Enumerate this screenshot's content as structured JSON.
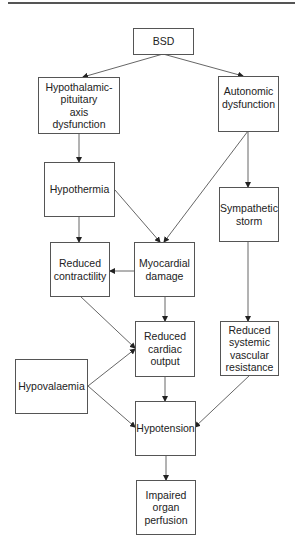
{
  "diagram": {
    "type": "flowchart",
    "nodes": {
      "bsd": "BSD",
      "hpa": "Hypothalamic-\npituitary\naxis\ndysfunction",
      "autonomic": "Autonomic\ndysfunction",
      "hypothermia": "Hypothermia",
      "sympathetic": "Sympathetic\nstorm",
      "contractility": "Reduced\ncontractility",
      "myocardial": "Myocardial\ndamage",
      "cardiac_output": "Reduced\ncardiac\noutput",
      "svr": "Reduced\nsystemic\nvascular\nresistance",
      "hypovolaemia": "Hypovalaemia",
      "hypotension": "Hypotension",
      "perfusion": "Impaired\norgan\nperfusion"
    },
    "edges": [
      [
        "BSD",
        "Hypothalamic-pituitary axis dysfunction"
      ],
      [
        "BSD",
        "Autonomic dysfunction"
      ],
      [
        "Hypothalamic-pituitary axis dysfunction",
        "Hypothermia"
      ],
      [
        "Autonomic dysfunction",
        "Myocardial damage"
      ],
      [
        "Autonomic dysfunction",
        "Sympathetic storm"
      ],
      [
        "Hypothermia",
        "Reduced contractility"
      ],
      [
        "Hypothermia",
        "Myocardial damage"
      ],
      [
        "Myocardial damage",
        "Reduced contractility"
      ],
      [
        "Myocardial damage",
        "Reduced cardiac output"
      ],
      [
        "Reduced contractility",
        "Reduced cardiac output"
      ],
      [
        "Sympathetic storm",
        "Reduced systemic vascular resistance"
      ],
      [
        "Hypovalaemia",
        "Reduced cardiac output"
      ],
      [
        "Hypovalaemia",
        "Hypotension"
      ],
      [
        "Reduced cardiac output",
        "Hypotension"
      ],
      [
        "Reduced systemic vascular resistance",
        "Hypotension"
      ],
      [
        "Hypotension",
        "Impaired organ perfusion"
      ]
    ]
  }
}
